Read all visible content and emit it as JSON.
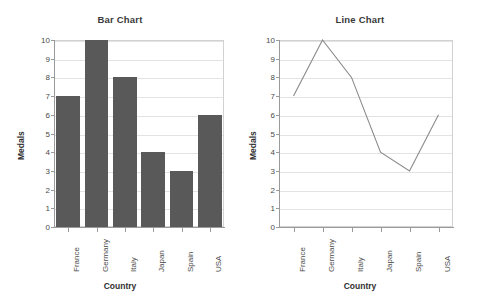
{
  "chart_data": [
    {
      "type": "bar",
      "title": "Bar Chart",
      "xlabel": "Country",
      "ylabel": "Medals",
      "categories": [
        "France",
        "Germany",
        "Italy",
        "Japan",
        "Spain",
        "USA"
      ],
      "values": [
        7,
        10,
        8,
        4,
        3,
        6
      ],
      "ylim": [
        0,
        10
      ],
      "yticks": [
        0,
        1,
        2,
        3,
        4,
        5,
        6,
        7,
        8,
        9,
        10
      ],
      "ytick_labels": [
        "0",
        "1",
        "2",
        "3",
        "4",
        "5",
        "6",
        "7",
        "8",
        "9",
        "10"
      ],
      "grid": true,
      "legend": false,
      "bar_color": "#595959",
      "grid_color": "#e3e3e3",
      "axis_color": "#9a9a9a"
    },
    {
      "type": "line",
      "title": "Line Chart",
      "xlabel": "Country",
      "ylabel": "Medals",
      "categories": [
        "France",
        "Germany",
        "Italy",
        "Japan",
        "Spain",
        "USA"
      ],
      "values": [
        7,
        10,
        8,
        4,
        3,
        6
      ],
      "ylim": [
        0,
        10
      ],
      "yticks": [
        0,
        1,
        2,
        3,
        4,
        5,
        6,
        7,
        8,
        9,
        10
      ],
      "ytick_labels": [
        "0",
        "1",
        "2",
        "3",
        "4",
        "5",
        "6",
        "7",
        "8",
        "9",
        "10"
      ],
      "grid": true,
      "legend": false,
      "line_color": "#8a8a8a",
      "grid_color": "#e3e3e3",
      "axis_color": "#9a9a9a"
    }
  ],
  "bar_panel": {
    "title": "Bar Chart",
    "xlabel": "Country",
    "ylabel": "Medals"
  },
  "line_panel": {
    "title": "Line Chart",
    "xlabel": "Country",
    "ylabel": "Medals"
  }
}
